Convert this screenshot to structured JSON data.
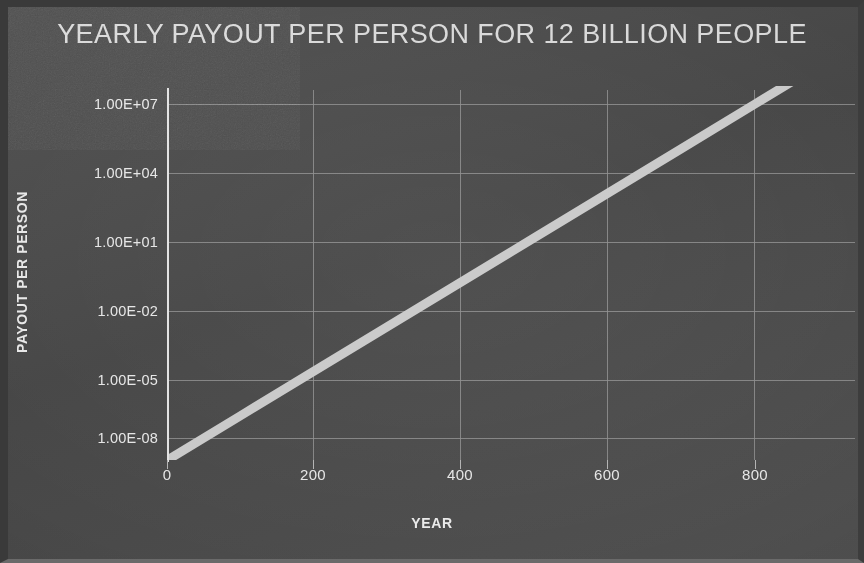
{
  "chart_data": {
    "type": "line",
    "title": "YEARLY PAYOUT PER PERSON FOR 12 BILLION PEOPLE",
    "xlabel": "YEAR",
    "ylabel": "PAYOUT PER PERSON",
    "yscale": "log",
    "xscale": "linear",
    "grid": true,
    "legend": "none",
    "xlim": [
      0,
      900
    ],
    "ylim": [
      1e-09,
      100000000.0
    ],
    "xticks": [
      0,
      200,
      400,
      600,
      800
    ],
    "xtick_labels": [
      "0",
      "200",
      "400",
      "600",
      "800"
    ],
    "yticks": [
      10000000.0,
      10000.0,
      10.0,
      0.01,
      1e-05,
      1e-08
    ],
    "ytick_labels": [
      "1.00E+07",
      "1.00E+04",
      "1.00E+01",
      "1.00E-02",
      "1.00E-05",
      "1.00E-08"
    ],
    "series": [
      {
        "name": "payout-per-person",
        "color": "#c9c9c9",
        "line_width_px": 9,
        "x": [
          0,
          100,
          200,
          300,
          400,
          500,
          600,
          700,
          800,
          900
        ],
        "y": [
          1e-09,
          1e-07,
          1e-05,
          0.001,
          0.1,
          10.0,
          1000.0,
          100000.0,
          10000000.0,
          1000000000.0
        ]
      }
    ]
  },
  "figure": {
    "background_color": "#4a4a4a",
    "text_color": "#e6e6e6",
    "grid_color": "#8e8e8e",
    "axis_color": "#e2e2e2",
    "series_color": "#c9c9c9"
  }
}
